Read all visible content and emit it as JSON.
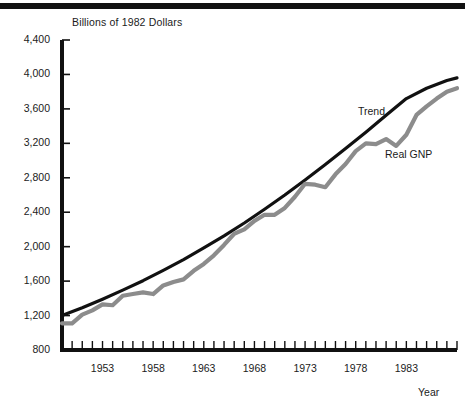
{
  "figure": {
    "top_rule": true,
    "axis_color": "#111111",
    "background": "#ffffff"
  },
  "chart_data": {
    "type": "line",
    "title": "",
    "ylabel": "Billions of 1982 Dollars",
    "xlabel": "Year",
    "ylim": [
      800,
      4400
    ],
    "xlim": [
      1949,
      1988
    ],
    "grid": false,
    "legend_position": "inline-annotation",
    "ytick_labels": [
      "4,400",
      "4,000",
      "3,600",
      "3,200",
      "2,800",
      "2,400",
      "2,000",
      "1,600",
      "1,200",
      "800"
    ],
    "ytick_values": [
      4400,
      4000,
      3600,
      3200,
      2800,
      2400,
      2000,
      1600,
      1200,
      800
    ],
    "xtick_labels": [
      "1953",
      "1958",
      "1963",
      "1968",
      "1973",
      "1978",
      "1983"
    ],
    "xtick_values": [
      1953,
      1958,
      1963,
      1968,
      1973,
      1978,
      1983
    ],
    "minor_xticks_every": 1,
    "series": [
      {
        "name": "Trend",
        "color": "#111111",
        "width": 3.2,
        "x": [
          1949,
          1951,
          1953,
          1955,
          1957,
          1959,
          1961,
          1963,
          1965,
          1967,
          1969,
          1971,
          1973,
          1975,
          1977,
          1979,
          1981,
          1983,
          1985,
          1987,
          1988
        ],
        "values": [
          1200,
          1290,
          1390,
          1495,
          1605,
          1725,
          1850,
          1985,
          2125,
          2275,
          2435,
          2600,
          2775,
          2955,
          3140,
          3330,
          3525,
          3720,
          3840,
          3930,
          3960
        ]
      },
      {
        "name": "Real GNP",
        "color": "#8c8c8c",
        "width": 4.2,
        "x": [
          1949,
          1950,
          1951,
          1952,
          1953,
          1954,
          1955,
          1956,
          1957,
          1958,
          1959,
          1960,
          1961,
          1962,
          1963,
          1964,
          1965,
          1966,
          1967,
          1968,
          1969,
          1970,
          1971,
          1972,
          1973,
          1974,
          1975,
          1976,
          1977,
          1978,
          1979,
          1980,
          1981,
          1982,
          1983,
          1984,
          1985,
          1986,
          1987,
          1988
        ],
        "values": [
          1110,
          1110,
          1210,
          1260,
          1330,
          1320,
          1430,
          1450,
          1470,
          1450,
          1550,
          1590,
          1620,
          1720,
          1800,
          1900,
          2020,
          2150,
          2200,
          2300,
          2370,
          2370,
          2450,
          2580,
          2730,
          2720,
          2690,
          2840,
          2960,
          3110,
          3200,
          3190,
          3250,
          3170,
          3300,
          3530,
          3630,
          3720,
          3800,
          3840
        ]
      }
    ],
    "annotations": [
      {
        "text": "Trend",
        "for": "Trend"
      },
      {
        "text": "Real GNP",
        "for": "Real GNP"
      }
    ]
  }
}
